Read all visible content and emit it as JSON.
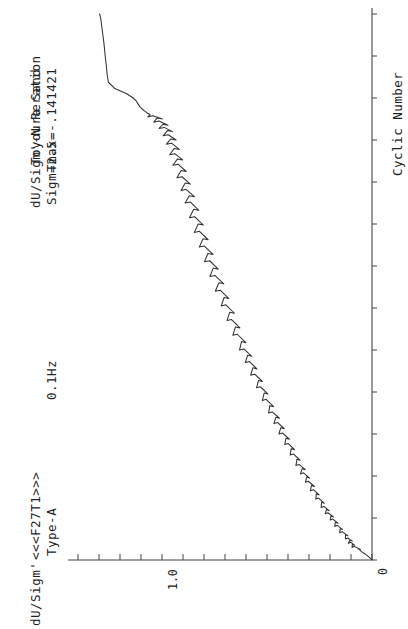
{
  "figure": {
    "id_label": "<<<F27T1>>>",
    "main_title": "dU/Sigm'-N Reration",
    "material": "Toyoura Sand",
    "type_label": "Type-A",
    "frequency": "0.1Hz",
    "sigma": "Sigm=2.5",
    "tmax": "Tmax=-.141421",
    "orientation": "rotated-90-ccw",
    "line_color": "#333333",
    "axis_color": "#444444"
  },
  "chart_data": {
    "type": "line",
    "title": "<<<F27T1>>>  dU/Sigm'-N Reration",
    "subtitle": "Type-A  0.1Hz  Sigm=2.5",
    "annotations": [
      "Toyoura Sand",
      "Tmax=-.141421"
    ],
    "xlabel": "Cyclic Number",
    "ylabel": "dU/Sigm'",
    "xlim": [
      0,
      26
    ],
    "ylim": [
      0,
      1.45
    ],
    "x_ticks": [
      0,
      2,
      4,
      6,
      8,
      10,
      12,
      14,
      16,
      18,
      20,
      22,
      24,
      26
    ],
    "x_tick_labels": [
      "0",
      "",
      "",
      "",
      "",
      "",
      "",
      "",
      "",
      "",
      "",
      "",
      "",
      ""
    ],
    "y_ticks": [
      0,
      0.1,
      0.2,
      0.3,
      0.4,
      0.5,
      0.6,
      0.7,
      0.8,
      0.9,
      1.0,
      1.1,
      1.2,
      1.3,
      1.4
    ],
    "y_tick_labels": [
      "0",
      "",
      "",
      "",
      "",
      "",
      "",
      "",
      "",
      "",
      "1.0",
      "",
      "",
      "",
      ""
    ],
    "grid": false,
    "legend": "none",
    "series": [
      {
        "name": "dU/Sigm'",
        "x": [
          0.0,
          0.1,
          0.2,
          0.3,
          0.4,
          0.5,
          0.6,
          0.7,
          0.8,
          0.9,
          1.0,
          1.15,
          1.3,
          1.45,
          1.6,
          1.75,
          1.9,
          2.05,
          2.2,
          2.35,
          2.5,
          2.7,
          2.9,
          3.1,
          3.3,
          3.5,
          3.7,
          3.9,
          4.1,
          4.3,
          4.5,
          4.75,
          5.0,
          5.25,
          5.5,
          5.75,
          6.0,
          6.25,
          6.5,
          6.75,
          7.0,
          7.3,
          7.6,
          7.9,
          8.2,
          8.5,
          8.8,
          9.1,
          9.4,
          9.7,
          10.0,
          10.35,
          10.7,
          11.05,
          11.4,
          11.75,
          12.1,
          12.45,
          12.8,
          13.15,
          13.5,
          13.85,
          14.2,
          14.55,
          14.9,
          15.25,
          15.6,
          15.95,
          16.3,
          16.65,
          17.0,
          17.3,
          17.6,
          17.9,
          18.2,
          18.5,
          18.8,
          19.05,
          19.3,
          19.55,
          19.8,
          20.0,
          20.2,
          20.4,
          20.55,
          20.7,
          20.85,
          21.0,
          21.1,
          21.2,
          21.3,
          21.4,
          21.5,
          21.6,
          21.72,
          21.85,
          22.0,
          22.2,
          22.45,
          22.75,
          23.1,
          23.5,
          24.0,
          24.6,
          25.2,
          25.8,
          26.0
        ],
        "y": [
          0.0,
          0.01,
          0.022,
          0.036,
          0.052,
          0.07,
          0.086,
          0.098,
          0.104,
          0.11,
          0.118,
          0.132,
          0.146,
          0.158,
          0.17,
          0.182,
          0.192,
          0.204,
          0.216,
          0.226,
          0.236,
          0.25,
          0.262,
          0.276,
          0.288,
          0.3,
          0.312,
          0.324,
          0.336,
          0.346,
          0.358,
          0.372,
          0.386,
          0.4,
          0.412,
          0.426,
          0.44,
          0.452,
          0.464,
          0.476,
          0.49,
          0.506,
          0.52,
          0.534,
          0.548,
          0.562,
          0.576,
          0.59,
          0.602,
          0.616,
          0.63,
          0.646,
          0.662,
          0.676,
          0.69,
          0.704,
          0.718,
          0.732,
          0.746,
          0.758,
          0.772,
          0.786,
          0.798,
          0.812,
          0.824,
          0.836,
          0.848,
          0.86,
          0.872,
          0.882,
          0.894,
          0.904,
          0.914,
          0.924,
          0.934,
          0.944,
          0.954,
          0.962,
          0.97,
          0.978,
          0.986,
          0.994,
          1.002,
          1.012,
          1.022,
          1.034,
          1.048,
          1.062,
          1.078,
          1.094,
          1.11,
          1.124,
          1.136,
          1.146,
          1.154,
          1.162,
          1.178,
          1.21,
          1.268,
          1.3,
          1.306,
          1.31,
          1.316,
          1.322,
          1.33,
          1.338,
          1.344
        ],
        "description": "Excess pore pressure ratio rises with sawtooth cyclic oscillations, then jumps to a plateau near 1.3 after liquefaction onset"
      }
    ]
  }
}
